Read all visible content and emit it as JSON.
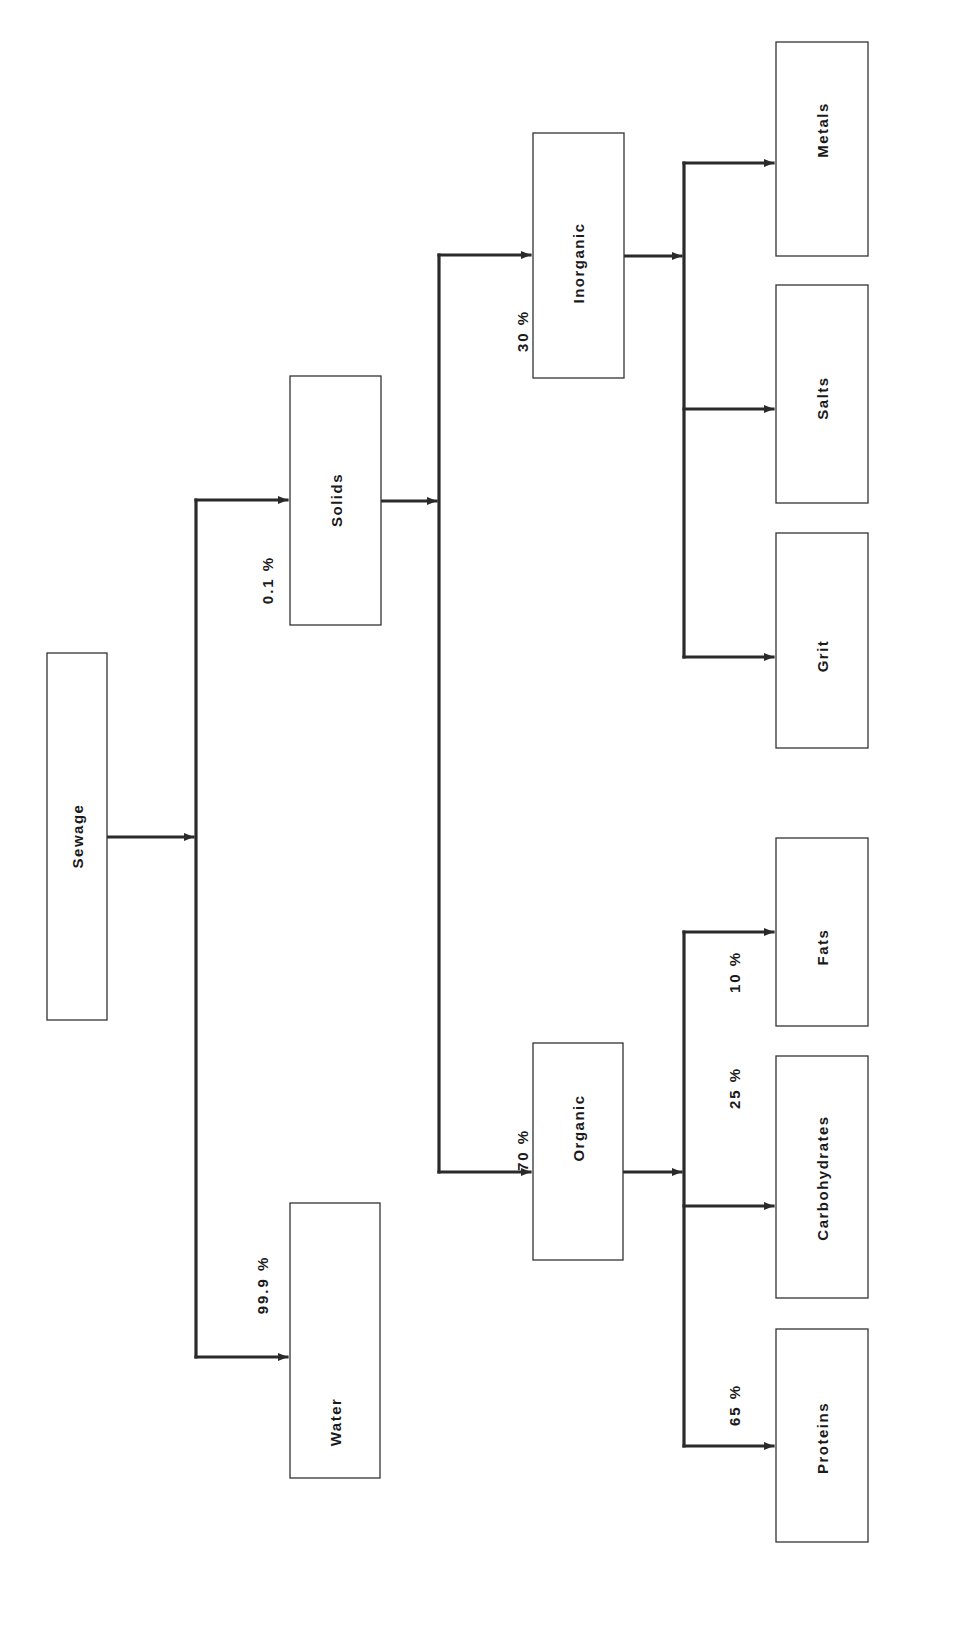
{
  "diagram": {
    "orientation": "rotated 90° counter-clockwise (text reads bottom-to-top)",
    "colors": {
      "line": "#2a2a2a",
      "box_border": "#333333",
      "text": "#1a1a1a",
      "background": "#ffffff"
    },
    "nodes": {
      "sewage": {
        "label": "Sewage"
      },
      "solids": {
        "label": "Solids"
      },
      "water": {
        "label": "Water"
      },
      "inorganic": {
        "label": "Inorganic"
      },
      "organic": {
        "label": "Organic"
      },
      "metals": {
        "label": "Metals"
      },
      "salts": {
        "label": "Salts"
      },
      "grit": {
        "label": "Grit"
      },
      "fats": {
        "label": "Fats"
      },
      "carbohydrates": {
        "label": "Carbohydrates"
      },
      "proteins": {
        "label": "Proteins"
      }
    },
    "edges": {
      "sewage_solids": {
        "from": "Sewage",
        "to": "Solids",
        "percent": "0.1 %"
      },
      "sewage_water": {
        "from": "Sewage",
        "to": "Water",
        "percent": "99.9 %"
      },
      "solids_inorganic": {
        "from": "Solids",
        "to": "Inorganic",
        "percent": "30 %"
      },
      "solids_organic": {
        "from": "Solids",
        "to": "Organic",
        "percent": "70 %"
      },
      "inorganic_metals": {
        "from": "Inorganic",
        "to": "Metals",
        "percent": ""
      },
      "inorganic_salts": {
        "from": "Inorganic",
        "to": "Salts",
        "percent": ""
      },
      "inorganic_grit": {
        "from": "Inorganic",
        "to": "Grit",
        "percent": ""
      },
      "organic_fats": {
        "from": "Organic",
        "to": "Fats",
        "percent": "10 %"
      },
      "organic_carbohydrates": {
        "from": "Organic",
        "to": "Carbohydrates",
        "percent": "25 %"
      },
      "organic_proteins": {
        "from": "Organic",
        "to": "Proteins",
        "percent": "65 %"
      }
    }
  }
}
